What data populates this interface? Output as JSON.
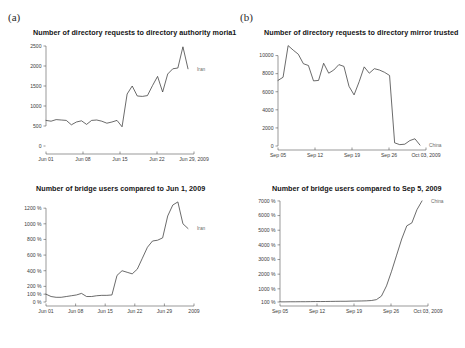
{
  "figure": {
    "panel_a_label": "(a)",
    "panel_b_label": "(b)",
    "caption": ""
  },
  "chart_data": [
    {
      "id": "a-top",
      "type": "line",
      "title": "Number of directory requests to directory authority moria1",
      "xlabel": "",
      "ylabel": "",
      "legend": [
        "Iran"
      ],
      "legend_position": "right",
      "grid": false,
      "xtick_labels": [
        "Jun 01",
        "Jun 08",
        "Jun 15",
        "Jun 22",
        "Jun 29, 2009"
      ],
      "ytick_labels": [
        "0",
        "500",
        "1000",
        "1500",
        "2000",
        "2500"
      ],
      "ylim": [
        0,
        2600
      ],
      "xlim": [
        0,
        29
      ],
      "series": [
        {
          "name": "Iran",
          "color": "#3a3a3a",
          "x": [
            0,
            1,
            2,
            3,
            4,
            5,
            6,
            7,
            8,
            9,
            10,
            11,
            12,
            13,
            14,
            15,
            16,
            17,
            18,
            19,
            20,
            21,
            22,
            23,
            24,
            25,
            26,
            27,
            28
          ],
          "values": [
            640,
            620,
            660,
            650,
            640,
            530,
            600,
            630,
            540,
            640,
            650,
            620,
            570,
            600,
            640,
            480,
            1300,
            1500,
            1250,
            1240,
            1260,
            1510,
            1740,
            1350,
            1800,
            1930,
            1950,
            2480,
            1930
          ]
        }
      ]
    },
    {
      "id": "a-bottom",
      "type": "line",
      "title": "Number of bridge users compared to Jun 1, 2009",
      "xlabel": "",
      "ylabel": "",
      "legend": [
        "Iran"
      ],
      "legend_position": "right",
      "grid": false,
      "xtick_labels": [
        "Jun 01",
        "Jun 08",
        "Jun 15",
        "Jun 22",
        "Jun 29",
        "2009"
      ],
      "ytick_labels": [
        "0 %",
        "100 %",
        "200 %",
        "400 %",
        "600 %",
        "800 %",
        "1000 %",
        "1200 %"
      ],
      "ylim": [
        0,
        1330
      ],
      "xlim": [
        0,
        29
      ],
      "series": [
        {
          "name": "Iran",
          "color": "#3a3a3a",
          "x": [
            0,
            1,
            2,
            3,
            4,
            5,
            6,
            7,
            8,
            9,
            10,
            11,
            12,
            13,
            14,
            15,
            16,
            17,
            18,
            19,
            20,
            21,
            22,
            23,
            24,
            25,
            26,
            27,
            28
          ],
          "values": [
            100,
            70,
            60,
            60,
            70,
            80,
            90,
            110,
            70,
            70,
            80,
            85,
            85,
            90,
            340,
            400,
            380,
            360,
            420,
            560,
            700,
            780,
            790,
            820,
            1100,
            1240,
            1280,
            1000,
            940
          ]
        }
      ]
    },
    {
      "id": "b-top",
      "type": "line",
      "title": "Number of directory requests to directory mirror trusted",
      "xlabel": "",
      "ylabel": "",
      "legend": [
        "China"
      ],
      "legend_position": "right",
      "grid": false,
      "xtick_labels": [
        "Sep 05",
        "Sep 12",
        "Sep 19",
        "Sep 26",
        "Oct 03, 2009"
      ],
      "ytick_labels": [
        "0",
        "2000",
        "4000",
        "6000",
        "8000",
        "10000"
      ],
      "ylim": [
        0,
        11500
      ],
      "xlim": [
        0,
        29
      ],
      "series": [
        {
          "name": "China",
          "color": "#3a3a3a",
          "x": [
            0,
            1,
            2,
            3,
            4,
            5,
            6,
            7,
            8,
            9,
            10,
            11,
            12,
            13,
            14,
            15,
            16,
            17,
            18,
            19,
            20,
            21,
            22,
            23,
            24,
            25,
            26,
            27,
            28
          ],
          "values": [
            7250,
            7600,
            11100,
            10600,
            10150,
            9100,
            8900,
            7200,
            7250,
            9150,
            8050,
            8400,
            9000,
            8800,
            6600,
            5650,
            7100,
            8750,
            8050,
            8550,
            8400,
            8150,
            7800,
            350,
            150,
            200,
            600,
            800,
            100
          ]
        }
      ]
    },
    {
      "id": "b-bottom",
      "type": "line",
      "title": "Number of bridge users compared to Sep 5, 2009",
      "xlabel": "",
      "ylabel": "",
      "legend": [
        "China"
      ],
      "legend_position": "right",
      "grid": false,
      "xtick_labels": [
        "Sep 05",
        "Sep 12",
        "Sep 19",
        "Sep 26",
        "Oct 03, 2009"
      ],
      "ytick_labels": [
        "100 %",
        "1000 %",
        "2000 %",
        "3000 %",
        "4000 %",
        "5000 %",
        "6000 %",
        "7000 %"
      ],
      "ylim": [
        100,
        7200
      ],
      "xlim": [
        0,
        29
      ],
      "series": [
        {
          "name": "China",
          "color": "#3a3a3a",
          "x": [
            0,
            1,
            2,
            3,
            4,
            5,
            6,
            7,
            8,
            9,
            10,
            11,
            12,
            13,
            14,
            15,
            16,
            17,
            18,
            19,
            20,
            21,
            22,
            23,
            24,
            25,
            26,
            27,
            28
          ],
          "values": [
            110,
            110,
            115,
            115,
            120,
            120,
            125,
            130,
            130,
            135,
            140,
            145,
            150,
            150,
            160,
            165,
            170,
            180,
            200,
            260,
            500,
            1200,
            2200,
            3300,
            4400,
            5300,
            5500,
            6400,
            7000
          ]
        }
      ]
    }
  ]
}
